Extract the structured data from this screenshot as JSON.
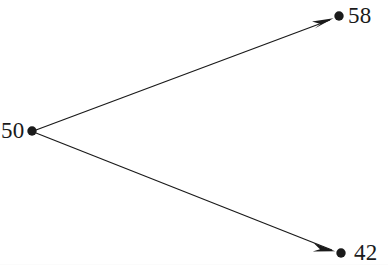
{
  "figure": {
    "type": "state-transition-diagram",
    "background_color": "#ffffff",
    "stroke_color": "#1a1a1a",
    "width": 388,
    "height": 278
  },
  "nodes": [
    {
      "id": "source",
      "label": "50",
      "x": 32,
      "y": 131,
      "radius": 4.6,
      "label_position": "left"
    },
    {
      "id": "upper",
      "label": "58",
      "x": 339,
      "y": 16,
      "radius": 4.6,
      "label_position": "right"
    },
    {
      "id": "lower",
      "label": "42",
      "x": 341,
      "y": 253,
      "radius": 4.6,
      "label_position": "right"
    }
  ],
  "edges": [
    {
      "id": "edge-50-to-58",
      "from": "50",
      "to": "58",
      "from_x": 32,
      "from_y": 131,
      "to_x": 339,
      "to_y": 16,
      "arrowhead": "barbed",
      "directed": true
    },
    {
      "id": "edge-50-to-42",
      "from": "50",
      "to": "42",
      "from_x": 32,
      "from_y": 131,
      "to_x": 341,
      "to_y": 253,
      "arrowhead": "barbed",
      "directed": true
    }
  ]
}
